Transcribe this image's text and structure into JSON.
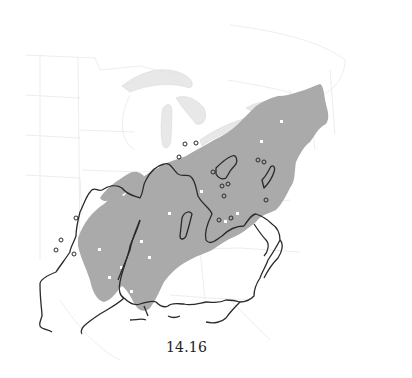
{
  "figure": {
    "caption": "14.16",
    "type": "species range map",
    "region": "Eastern United States"
  },
  "legend_semantics": {
    "shaded_cells": "occurrence grid cells",
    "outline": "range boundary",
    "small_circles": "isolated outlying occurrences"
  },
  "colors": {
    "background": "#ffffff",
    "occurrence_fill": "#aaaaaa",
    "range_outline": "#2a2a2a",
    "state_borders": "#dcdcdc",
    "great_lakes": "#e6e6e6"
  }
}
